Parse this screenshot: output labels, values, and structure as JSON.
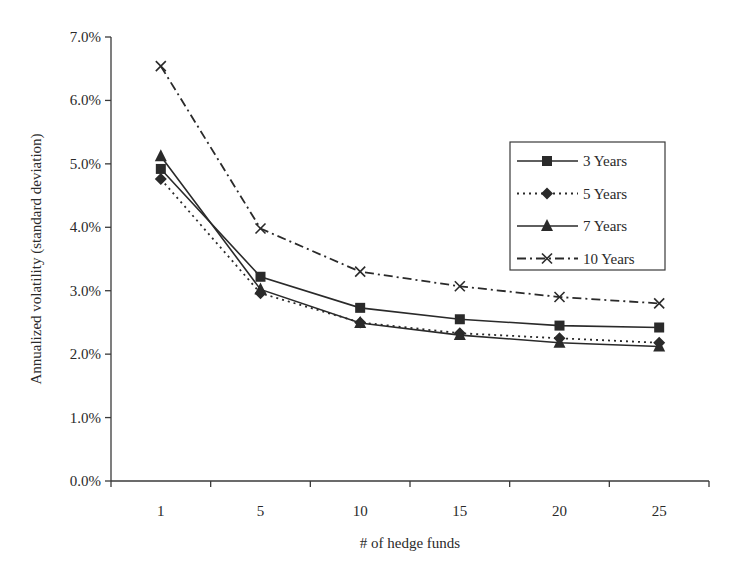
{
  "chart_data": {
    "type": "line",
    "title": "",
    "xlabel": "# of hedge funds",
    "ylabel": "Annualized volatility (standard deviation)",
    "categories": [
      "1",
      "5",
      "10",
      "15",
      "20",
      "25"
    ],
    "y_ticks": [
      "0.0%",
      "1.0%",
      "2.0%",
      "3.0%",
      "4.0%",
      "5.0%",
      "6.0%",
      "7.0%"
    ],
    "ylim": [
      0,
      7
    ],
    "y_unit": "%",
    "grid": false,
    "legend_position": "upper right, inside plot",
    "series": [
      {
        "name": "3 Years",
        "marker": "square",
        "line_style": "solid",
        "values": [
          4.92,
          3.22,
          2.73,
          2.55,
          2.45,
          2.42
        ]
      },
      {
        "name": "5 Years",
        "marker": "diamond",
        "line_style": "dotted",
        "values": [
          4.76,
          2.96,
          2.5,
          2.33,
          2.25,
          2.18
        ]
      },
      {
        "name": "7 Years",
        "marker": "triangle",
        "line_style": "solid",
        "values": [
          5.12,
          3.02,
          2.49,
          2.3,
          2.18,
          2.12
        ]
      },
      {
        "name": "10 Years",
        "marker": "x",
        "line_style": "dash-dot",
        "values": [
          6.54,
          3.98,
          3.3,
          3.07,
          2.9,
          2.8
        ]
      }
    ],
    "colors": {
      "line": "#2a2a2a",
      "axis": "#3a3a3a",
      "background": "#ffffff"
    }
  }
}
